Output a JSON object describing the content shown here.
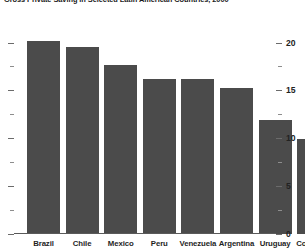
{
  "chart_data": {
    "type": "bar",
    "title": "Gross Private Saving in Selected Latin American Countries, 2000",
    "xlabel": "",
    "ylabel": "",
    "categories": [
      "Brazil",
      "Chile",
      "Mexico",
      "Peru",
      "Venezuela",
      "Argentina",
      "Uruguay",
      "Colombia"
    ],
    "values": [
      20.2,
      19.6,
      17.7,
      16.2,
      16.2,
      15.3,
      11.9,
      9.9
    ],
    "ylim": [
      0,
      21
    ],
    "ytick_labels": [
      "0",
      "5",
      "10",
      "15",
      "20"
    ],
    "ytick_values": [
      0,
      5,
      10,
      15,
      20
    ],
    "yminor_tick_values": [
      2.5,
      7.5,
      12.5,
      17.5
    ],
    "grid": false,
    "legend": null,
    "bar_color": "#4b4b4b",
    "axis_color": "#5a5a5a",
    "background_color": "#ffffff",
    "ytick_side": "right"
  },
  "axis": {
    "y_labels": [
      {
        "text": "20",
        "value": 20
      },
      {
        "text": "15",
        "value": 15
      },
      {
        "text": "10",
        "value": 10
      },
      {
        "text": "5",
        "value": 5
      },
      {
        "text": "0",
        "value": 0
      }
    ]
  }
}
